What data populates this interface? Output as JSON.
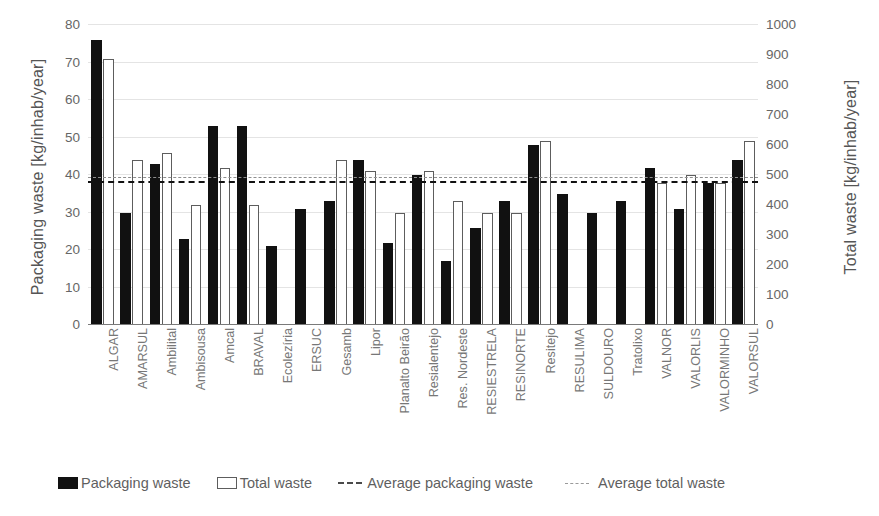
{
  "chart_data": {
    "type": "bar",
    "title": "",
    "subtitle": "",
    "xlabel": "",
    "ylabel": "Packaging waste  [kg/inhab/year]",
    "y2label": "Total waste  [kg/inhab/year]",
    "ylim": [
      0,
      80
    ],
    "y2lim": [
      0,
      1000
    ],
    "yticks": [
      80,
      70,
      60,
      50,
      40,
      30,
      20,
      10,
      0
    ],
    "y2ticks": [
      1000,
      900,
      800,
      700,
      600,
      500,
      400,
      300,
      200,
      100,
      0
    ],
    "grid": true,
    "legend_position": "bottom",
    "categories": [
      "ALGAR",
      "AMARSUL",
      "Ambilital",
      "Ambisousa",
      "Amcal",
      "BRAVAL",
      "Ecolezíria",
      "ERSUC",
      "Gesamb",
      "Lipor",
      "Planalto Beirão",
      "Resialentejo",
      "Res. Nordeste",
      "RESIESTRELA",
      "RESINORTE",
      "Resitejo",
      "RESULIMA",
      "SULDOURO",
      "Tratolixo",
      "VALNOR",
      "VALORLIS",
      "VALORMINHO",
      "VALORSUL"
    ],
    "series": [
      {
        "name": "Packaging waste",
        "axis": "left",
        "unit": "kg/inhab/year",
        "style": "filled-bar",
        "color": "#111111",
        "values": [
          76,
          30,
          43,
          23,
          53,
          53,
          21,
          31,
          33,
          44,
          22,
          40,
          17,
          26,
          33,
          48,
          35,
          30,
          33,
          42,
          31,
          38,
          44
        ]
      },
      {
        "name": "Total waste",
        "axis": "right",
        "unit": "kg/inhab/year",
        "style": "hollow-bar",
        "color": "#ffffff",
        "border_color": "#5d5d5d",
        "values_right_axis": [
          890,
          553,
          578,
          400,
          528,
          395,
          0,
          0,
          545,
          515,
          375,
          510,
          410,
          375,
          375,
          610,
          0,
          0,
          0,
          470,
          498,
          478,
          613
        ],
        "values": [
          71,
          44,
          46,
          32,
          42,
          32,
          0,
          0,
          44,
          41,
          30,
          41,
          33,
          30,
          30,
          49,
          0,
          0,
          0,
          38,
          40,
          38,
          49
        ]
      }
    ],
    "reference_lines": [
      {
        "name": "Average packaging waste",
        "axis": "left",
        "value": 38,
        "style": "dashed",
        "color": "#111111"
      },
      {
        "name": "Average total waste",
        "axis": "right",
        "value": 490,
        "value_left_axis_equivalent": 39.2,
        "style": "dashed",
        "color": "#8e8e8e"
      }
    ],
    "legend": [
      {
        "label": "Packaging waste",
        "marker": "filled-square"
      },
      {
        "label": "Total waste",
        "marker": "hollow-square"
      },
      {
        "label": "Average packaging waste",
        "marker": "dark-dashed-line"
      },
      {
        "label": "Average total waste",
        "marker": "light-dashed-line"
      }
    ]
  }
}
